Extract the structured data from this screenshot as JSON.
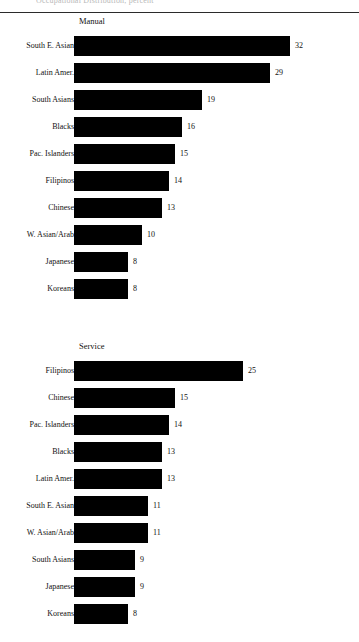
{
  "page": {
    "top_clipped_text": "Occupational Distribution, percent",
    "rule_color": "#2b2b2b",
    "bar_color": "#000000",
    "background_color": "#ffffff"
  },
  "chart_data": [
    {
      "type": "bar",
      "title": "Manual",
      "orientation": "horizontal",
      "xlabel": "",
      "ylabel": "",
      "xlim": [
        0,
        36
      ],
      "grid": false,
      "legend": "none",
      "value_labels": true,
      "categories": [
        "South E. Asian",
        "Latin Amer.",
        "South Asians",
        "Blacks",
        "Pac. Islanders",
        "Filipinos",
        "Chinese",
        "W. Asian/Arab",
        "Japanese",
        "Koreans"
      ],
      "values": [
        32,
        29,
        19,
        16,
        15,
        14,
        13,
        10,
        8,
        8
      ]
    },
    {
      "type": "bar",
      "title": "Service",
      "orientation": "horizontal",
      "xlabel": "",
      "ylabel": "",
      "xlim": [
        0,
        36
      ],
      "grid": false,
      "legend": "none",
      "value_labels": true,
      "categories": [
        "Filipinos",
        "Chinese",
        "Pac. Islanders",
        "Blacks",
        "Latin Amer.",
        "South E. Asian",
        "W. Asian/Arab",
        "South Asians",
        "Japanese",
        "Koreans"
      ],
      "values": [
        25,
        15,
        14,
        13,
        13,
        11,
        11,
        9,
        9,
        8
      ]
    }
  ]
}
